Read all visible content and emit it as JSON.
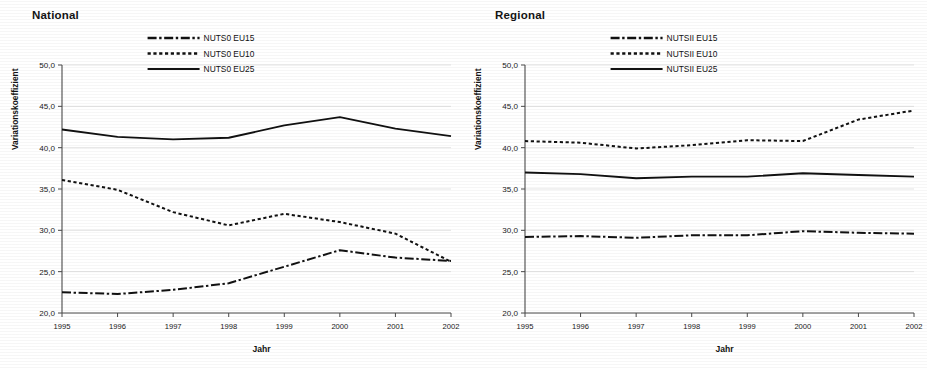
{
  "figure": {
    "panels": [
      {
        "key": "national",
        "title": "National",
        "axis": {
          "xlabel": "Jahr",
          "ylabel": "Variationskoeffizient"
        }
      },
      {
        "key": "regional",
        "title": "Regional",
        "axis": {
          "xlabel": "Jahr",
          "ylabel": "Variationskoeffizient"
        }
      }
    ]
  },
  "chart_data": [
    {
      "type": "line",
      "title": "National",
      "xlabel": "Jahr",
      "ylabel": "Variationskoeffizient",
      "x": [
        1995,
        1996,
        1997,
        1998,
        1999,
        2000,
        2001,
        2002
      ],
      "categories": [
        "1995",
        "1996",
        "1997",
        "1998",
        "1999",
        "2000",
        "2001",
        "2002"
      ],
      "xtick_labels": [
        "1995",
        "1996",
        "1997",
        "1998",
        "1999",
        "2000",
        "2001",
        "2002"
      ],
      "ytick_labels": [
        "20,0",
        "25,0",
        "30,0",
        "35,0",
        "40,0",
        "45,0",
        "50,0"
      ],
      "yticks": [
        20.0,
        25.0,
        30.0,
        35.0,
        40.0,
        45.0,
        50.0
      ],
      "ylim": [
        20.0,
        50.0
      ],
      "xlim": [
        1995,
        2002
      ],
      "grid": true,
      "legend_position": "top-center",
      "series": [
        {
          "name": "NUTS0 EU15",
          "style": "dashdot",
          "values": [
            22.5,
            22.3,
            22.8,
            23.6,
            25.6,
            27.6,
            26.7,
            26.3
          ]
        },
        {
          "name": "NUTS0 EU10",
          "style": "dotted",
          "values": [
            36.1,
            34.9,
            32.2,
            30.6,
            32.0,
            31.0,
            29.6,
            26.2
          ]
        },
        {
          "name": "NUTS0 EU25",
          "style": "solid",
          "values": [
            42.2,
            41.3,
            41.0,
            41.2,
            42.7,
            43.7,
            42.3,
            41.4
          ]
        }
      ]
    },
    {
      "type": "line",
      "title": "Regional",
      "xlabel": "Jahr",
      "ylabel": "Variationskoeffizient",
      "x": [
        1995,
        1996,
        1997,
        1998,
        1999,
        2000,
        2001,
        2002
      ],
      "categories": [
        "1995",
        "1996",
        "1997",
        "1998",
        "1999",
        "2000",
        "2001",
        "2002"
      ],
      "xtick_labels": [
        "1995",
        "1996",
        "1997",
        "1998",
        "1999",
        "2000",
        "2001",
        "2002"
      ],
      "ytick_labels": [
        "20,0",
        "25,0",
        "30,0",
        "35,0",
        "40,0",
        "45,0",
        "50,0"
      ],
      "yticks": [
        20.0,
        25.0,
        30.0,
        35.0,
        40.0,
        45.0,
        50.0
      ],
      "ylim": [
        20.0,
        50.0
      ],
      "xlim": [
        1995,
        2002
      ],
      "grid": true,
      "legend_position": "top-center",
      "series": [
        {
          "name": "NUTSII EU15",
          "style": "dashdot",
          "values": [
            29.2,
            29.3,
            29.1,
            29.4,
            29.4,
            29.9,
            29.7,
            29.6
          ]
        },
        {
          "name": "NUTSII EU10",
          "style": "dotted",
          "values": [
            40.8,
            40.6,
            39.9,
            40.3,
            40.9,
            40.8,
            43.4,
            44.5
          ]
        },
        {
          "name": "NUTSII EU25",
          "style": "solid",
          "values": [
            37.0,
            36.8,
            36.3,
            36.5,
            36.5,
            36.9,
            36.7,
            36.5
          ]
        }
      ]
    }
  ],
  "colors": {
    "series": "#111111",
    "grid": "#d8d8d8",
    "axis": "#4a4a4a",
    "text": "#121212",
    "background": "#ffffff"
  }
}
